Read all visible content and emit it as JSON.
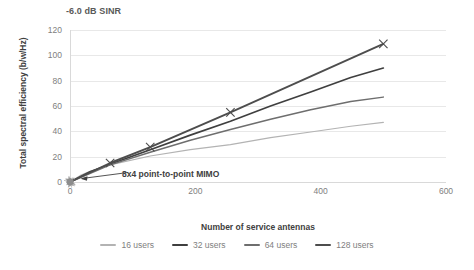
{
  "chart_data": {
    "type": "line",
    "title": "-6.0 dB SINR",
    "xlabel": "Number of service antennas",
    "ylabel": "Total spectral efficiency (b/w/Hz)",
    "xlim": [
      0,
      600
    ],
    "ylim": [
      0,
      120
    ],
    "xticks": [
      0,
      200,
      400,
      600
    ],
    "yticks": [
      0,
      20,
      40,
      60,
      80,
      100,
      120
    ],
    "grid": true,
    "legend_position": "bottom",
    "annotations": [
      {
        "text": "8x4 point-to-point MIMO",
        "points_to_x": 0,
        "points_to_y": 0
      }
    ],
    "series": [
      {
        "name": "16 users",
        "color": "#b3b3b3",
        "x": [
          0,
          16,
          32,
          64,
          128,
          192,
          256,
          320,
          384,
          448,
          500
        ],
        "values": [
          0,
          5.0,
          8.5,
          13.5,
          20.5,
          25.5,
          29.5,
          35.0,
          39.5,
          44.0,
          47.0
        ]
      },
      {
        "name": "32 users",
        "color": "#3f3f3f",
        "x": [
          0,
          32,
          64,
          128,
          192,
          256,
          320,
          384,
          448,
          500
        ],
        "values": [
          0,
          8.0,
          14.0,
          25.5,
          37.0,
          48.0,
          60.0,
          71.0,
          82.5,
          90.0
        ]
      },
      {
        "name": "64 users",
        "color": "#6e6e6e",
        "x": [
          0,
          64,
          128,
          192,
          256,
          320,
          384,
          448,
          500
        ],
        "values": [
          0,
          13.5,
          23.5,
          33.0,
          41.5,
          49.5,
          57.0,
          63.5,
          67.0
        ]
      },
      {
        "name": "128 users",
        "color": "#4d4d4d",
        "x": [
          0,
          64,
          128,
          256,
          500
        ],
        "values": [
          0,
          15.0,
          27.5,
          55.0,
          109.0
        ],
        "marker": "x",
        "marker_x": [
          64,
          128,
          256,
          500
        ],
        "marker_y": [
          15.0,
          27.5,
          55.0,
          109.0
        ]
      }
    ],
    "origin_cluster": {
      "description": "dense scatter cluster at origin",
      "x": 0,
      "y": 0,
      "color": "#8c8c8c"
    }
  },
  "yticks_text": [
    "120",
    "100",
    "80",
    "60",
    "40",
    "20",
    "0"
  ],
  "xticks_text": [
    "0",
    "200",
    "400",
    "600"
  ]
}
